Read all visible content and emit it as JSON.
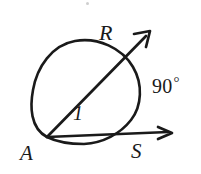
{
  "figure": {
    "kind": "geometry-diagram",
    "background_color": "#ffffff",
    "ink_color": "#1a1a1a",
    "labels": {
      "point_r": "R",
      "point_a": "A",
      "point_s": "S",
      "angle_number": "1",
      "arc_measure": "90",
      "degree_symbol": "°"
    },
    "geometry": {
      "circle": {
        "cx": 88,
        "cy": 92,
        "r": 52
      },
      "vertex_a": {
        "x": 47,
        "y": 137
      },
      "ray_ar_tip": {
        "x": 150,
        "y": 32
      },
      "ray_as_tip": {
        "x": 172,
        "y": 133
      },
      "point_r_on_circle": {
        "x": 118,
        "y": 62
      },
      "point_s_on_circle": {
        "x": 133,
        "y": 130
      }
    }
  }
}
